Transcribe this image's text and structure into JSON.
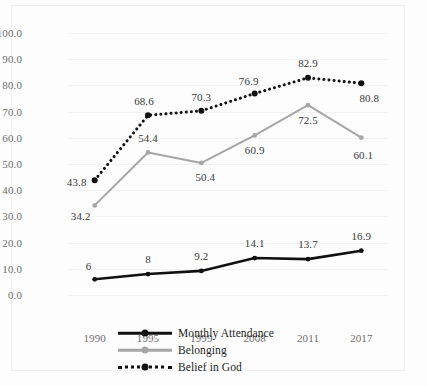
{
  "chart_data": {
    "type": "line",
    "title": "",
    "xlabel": "",
    "ylabel": "",
    "categories": [
      "1990",
      "1995",
      "1999",
      "2008",
      "2011",
      "2017"
    ],
    "ylim": [
      0,
      100
    ],
    "ytick_labels": [
      "0.0",
      "10.0",
      "20.0",
      "30.0",
      "40.0",
      "50.0",
      "60.0",
      "70.0",
      "80.0",
      "90.0",
      "100.0"
    ],
    "ytick_values": [
      0,
      10,
      20,
      30,
      40,
      50,
      60,
      70,
      80,
      90,
      100
    ],
    "grid": true,
    "legend_position": "bottom",
    "series": [
      {
        "name": "Monthly Attendance",
        "color": "#111111",
        "style": "solid",
        "values": [
          6,
          8,
          9.2,
          14.1,
          13.7,
          16.9
        ],
        "labels": [
          "6",
          "8",
          "9.2",
          "14.1",
          "13.7",
          "16.9"
        ]
      },
      {
        "name": "Belonging",
        "color": "#a6a6a6",
        "style": "solid",
        "values": [
          34.2,
          54.4,
          50.4,
          60.9,
          72.5,
          60.1
        ],
        "labels": [
          "34.2",
          "54.4",
          "50.4",
          "60.9",
          "72.5",
          "60.1"
        ]
      },
      {
        "name": "Belief in God",
        "color": "#111111",
        "style": "dotted",
        "values": [
          43.8,
          68.6,
          70.3,
          76.9,
          82.9,
          80.8
        ],
        "labels": [
          "43.8",
          "68.6",
          "70.3",
          "76.9",
          "82.9",
          "80.8"
        ]
      }
    ]
  },
  "legend": {
    "items": [
      {
        "label": "Monthly Attendance"
      },
      {
        "label": "Belonging"
      },
      {
        "label": "Belief in God"
      }
    ]
  }
}
